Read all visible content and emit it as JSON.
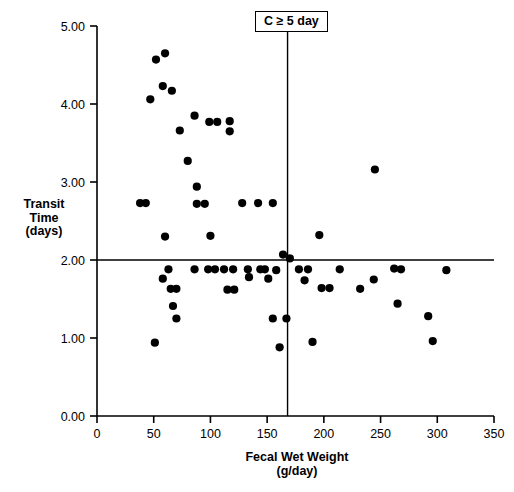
{
  "chart_data": {
    "type": "scatter",
    "title": "",
    "xlabel": "Fecal Wet Weight",
    "xlabel_units": "(g/day)",
    "ylabel_lines": [
      "Transit",
      "Time",
      "(days)"
    ],
    "xlim": [
      0,
      350
    ],
    "ylim": [
      0,
      5
    ],
    "xticks": [
      0,
      50,
      100,
      150,
      200,
      250,
      300,
      350
    ],
    "xtick_labels": [
      "0",
      "50",
      "100",
      "150",
      "200",
      "250",
      "300",
      "350"
    ],
    "yticks": [
      0,
      1,
      2,
      3,
      4,
      5
    ],
    "ytick_labels": [
      "0.00",
      "1.00",
      "2.00",
      "3.00",
      "4.00",
      "5.00"
    ],
    "grid": false,
    "legend": false,
    "marker": "filled-circle",
    "marker_color": "#000000",
    "marker_size": 4.6,
    "reference_lines": [
      {
        "orientation": "horizontal",
        "value": 2.0,
        "color": "#000000"
      },
      {
        "orientation": "vertical",
        "value": 168,
        "color": "#000000"
      }
    ],
    "annotations": [
      {
        "text": "C ≥ 5 day",
        "x": 168,
        "y": 5.0,
        "boxed": true,
        "leader_line": true
      }
    ],
    "points": [
      [
        52,
        4.57
      ],
      [
        60,
        4.65
      ],
      [
        58,
        4.23
      ],
      [
        66,
        4.17
      ],
      [
        47,
        4.06
      ],
      [
        86,
        3.85
      ],
      [
        99,
        3.77
      ],
      [
        106,
        3.77
      ],
      [
        117,
        3.78
      ],
      [
        73,
        3.66
      ],
      [
        117,
        3.65
      ],
      [
        80,
        3.27
      ],
      [
        88,
        2.94
      ],
      [
        245,
        3.16
      ],
      [
        38,
        2.73
      ],
      [
        43,
        2.73
      ],
      [
        88,
        2.72
      ],
      [
        95,
        2.72
      ],
      [
        128,
        2.73
      ],
      [
        142,
        2.73
      ],
      [
        155,
        2.73
      ],
      [
        60,
        2.3
      ],
      [
        100,
        2.31
      ],
      [
        196,
        2.32
      ],
      [
        164,
        2.07
      ],
      [
        170,
        2.02
      ],
      [
        63,
        1.88
      ],
      [
        86,
        1.88
      ],
      [
        98,
        1.88
      ],
      [
        104,
        1.88
      ],
      [
        112,
        1.88
      ],
      [
        120,
        1.88
      ],
      [
        133,
        1.88
      ],
      [
        144,
        1.88
      ],
      [
        148,
        1.88
      ],
      [
        158,
        1.87
      ],
      [
        178,
        1.88
      ],
      [
        186,
        1.88
      ],
      [
        214,
        1.88
      ],
      [
        262,
        1.89
      ],
      [
        268,
        1.88
      ],
      [
        308,
        1.87
      ],
      [
        58,
        1.76
      ],
      [
        134,
        1.78
      ],
      [
        151,
        1.76
      ],
      [
        183,
        1.74
      ],
      [
        244,
        1.75
      ],
      [
        65,
        1.63
      ],
      [
        70,
        1.63
      ],
      [
        115,
        1.62
      ],
      [
        121,
        1.62
      ],
      [
        198,
        1.64
      ],
      [
        205,
        1.64
      ],
      [
        232,
        1.63
      ],
      [
        67,
        1.41
      ],
      [
        265,
        1.44
      ],
      [
        70,
        1.25
      ],
      [
        155,
        1.25
      ],
      [
        167,
        1.25
      ],
      [
        292,
        1.28
      ],
      [
        51,
        0.94
      ],
      [
        161,
        0.88
      ],
      [
        190,
        0.95
      ],
      [
        296,
        0.96
      ]
    ]
  },
  "axes": {
    "x_label_main": "Fecal Wet Weight",
    "x_label_sub": "(g/day)",
    "y_label_line1": "Transit",
    "y_label_line2": "Time",
    "y_label_line3": "(days)"
  },
  "annotation": {
    "threshold_label": "C ≥ 5 day"
  }
}
